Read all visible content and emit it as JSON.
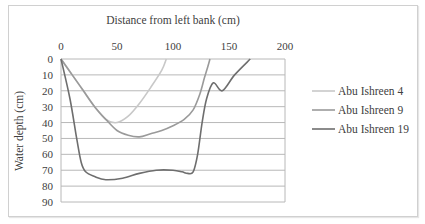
{
  "chart_data": {
    "type": "line",
    "title": "",
    "xlabel": "Distance from left bank (cm)",
    "ylabel": "Water depth (cm)",
    "xlim": [
      0,
      200
    ],
    "ylim": [
      0,
      90
    ],
    "y_inverted": true,
    "x_axis_position": "top",
    "x_ticks": [
      0,
      50,
      100,
      150,
      200
    ],
    "y_ticks": [
      0,
      10,
      20,
      30,
      40,
      50,
      60,
      70,
      80,
      90
    ],
    "grid": "horizontal",
    "legend_position": "right",
    "series": [
      {
        "name": "Abu Ishreen 4",
        "color": "#c8c8c8",
        "x": [
          0,
          10,
          20,
          30,
          40,
          50,
          60,
          70,
          80,
          90,
          94
        ],
        "y": [
          0,
          10,
          20,
          30,
          38,
          40,
          36,
          28,
          18,
          7,
          0
        ]
      },
      {
        "name": "Abu Ishreen 9",
        "color": "#9a9a9a",
        "x": [
          0,
          10,
          20,
          30,
          40,
          50,
          60,
          70,
          80,
          90,
          100,
          110,
          118,
          124,
          128,
          131,
          133
        ],
        "y": [
          0,
          10,
          20,
          30,
          38,
          45,
          48,
          49,
          47,
          45,
          42,
          38,
          32,
          22,
          12,
          5,
          0
        ]
      },
      {
        "name": "Abu Ishreen 19",
        "color": "#6e6e6e",
        "x": [
          0,
          8,
          14,
          18,
          22,
          30,
          40,
          55,
          70,
          85,
          100,
          108,
          113,
          118,
          122,
          126,
          130,
          136,
          144,
          155,
          169
        ],
        "y": [
          0,
          25,
          50,
          65,
          71,
          74,
          76,
          75,
          72,
          70,
          70,
          71,
          72,
          71,
          60,
          40,
          25,
          15,
          20,
          10,
          0
        ]
      }
    ]
  }
}
